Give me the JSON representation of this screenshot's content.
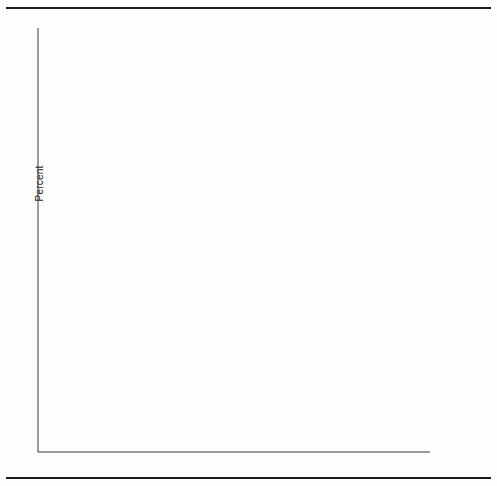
{
  "figure": {
    "ylabel": "Percent",
    "yticks": [
      5,
      10,
      15,
      20,
      25
    ],
    "xticks": [
      1950,
      1975,
      2000,
      2025
    ]
  },
  "chart_data": {
    "type": "line",
    "title": "",
    "xlabel": "",
    "ylabel": "Percent",
    "x": [
      1950,
      1975,
      2000,
      2025
    ],
    "xlim": [
      1944,
      2031
    ],
    "ylim": [
      3.0,
      27.6
    ],
    "grid": false,
    "legend_position": "right-labels-with-leader-lines",
    "xticklabels": [
      "1950",
      "1975",
      "2000",
      "2025"
    ],
    "yticklabels": [
      "5",
      "10",
      "15",
      "20",
      "25"
    ],
    "series": [
      {
        "name": "Western Europe",
        "values": [
          15.0,
          19.0,
          20.0,
          26.5
        ],
        "style": "solid",
        "label_y": 18
      },
      {
        "name": "Northern Europe",
        "values": [
          14.8,
          18.8,
          19.7,
          25.0
        ],
        "style": "solid",
        "label_y": 37
      },
      {
        "name": "Japan",
        "values": [
          7.6,
          12.0,
          19.6,
          24.6
        ],
        "style": "solid",
        "label_y": 51
      },
      {
        "name": "Southern Europe",
        "values": [
          12.5,
          14.5,
          19.7,
          24.2
        ],
        "style": "solid",
        "label_y": 65
      },
      {
        "name": "Northern America",
        "values": [
          12.4,
          14.4,
          16.6,
          21.2
        ],
        "style": "solid",
        "label_y": 98
      },
      {
        "name": "Eastern Europe",
        "values": [
          12.4,
          14.4,
          17.0,
          20.9
        ],
        "style": "solid",
        "label_y": 110
      },
      {
        "name": "Australia and New Zealand",
        "values": [
          12.3,
          12.9,
          15.5,
          20.6
        ],
        "style": "solid",
        "label_y": 122
      },
      {
        "name": "U.S.S.R.",
        "values": [
          7.8,
          13.0,
          17.4,
          19.0
        ],
        "style": "solid",
        "label_y": 148
      },
      {
        "name": "China",
        "values": [
          7.3,
          8.4,
          11.5,
          18.0
        ],
        "style": "solid",
        "label_y": 163
      },
      {
        "name": "Temperate South America",
        "values": [
          6.4,
          8.4,
          10.8,
          14.4
        ],
        "style": "solid",
        "label_y": 198
      },
      {
        "name": "Other East Asia",
        "values": [
          6.2,
          6.3,
          7.1,
          13.6
        ],
        "style": "solid",
        "label_y": 213
      },
      {
        "name": "Micronesia and Polynesia",
        "values": [
          6.1,
          6.0,
          6.8,
          11.9
        ],
        "style": "solid",
        "label_y": 255
      },
      {
        "name": "Caribbean",
        "values": [
          6.0,
          6.3,
          7.2,
          11.6
        ],
        "style": "solid",
        "label_y": 268
      },
      {
        "name": "Eastern South Asia",
        "values": [
          5.9,
          5.2,
          6.6,
          11.3
        ],
        "style": "dotted",
        "label_y": 286
      },
      {
        "name": "Middle South Asia",
        "values": [
          5.8,
          5.9,
          6.4,
          10.0
        ],
        "style": "solid",
        "label_y": 305
      },
      {
        "name": "Tropical South America",
        "values": [
          5.7,
          5.7,
          6.5,
          9.6
        ],
        "style": "solid",
        "label_y": 317
      },
      {
        "name": "Western Asia",
        "values": [
          5.6,
          5.5,
          6.4,
          9.2
        ],
        "style": "solid",
        "label_y": 329
      },
      {
        "name": "Middle America",
        "values": [
          5.5,
          5.4,
          6.3,
          8.8
        ],
        "style": "solid",
        "label_y": 341
      },
      {
        "name": "Northern Africa",
        "values": [
          5.4,
          5.3,
          6.2,
          8.4
        ],
        "style": "solid",
        "label_y": 353
      },
      {
        "name": "Melanesia",
        "values": [
          5.3,
          4.9,
          5.9,
          8.0
        ],
        "style": "dashed",
        "label_y": 365
      },
      {
        "name": "Southern Africa",
        "values": [
          5.2,
          5.2,
          6.0,
          7.5
        ],
        "style": "solid",
        "label_y": 377
      },
      {
        "name": "Middle Africa",
        "values": [
          5.1,
          5.1,
          5.6,
          7.0
        ],
        "style": "solid",
        "label_y": 389
      },
      {
        "name": "Western Africa",
        "values": [
          4.9,
          4.8,
          5.1,
          6.3
        ],
        "style": "solid",
        "label_y": 404
      },
      {
        "name": "Eastern Africa",
        "values": [
          4.8,
          4.4,
          4.6,
          5.8
        ],
        "style": "solid",
        "label_y": 416
      }
    ]
  }
}
